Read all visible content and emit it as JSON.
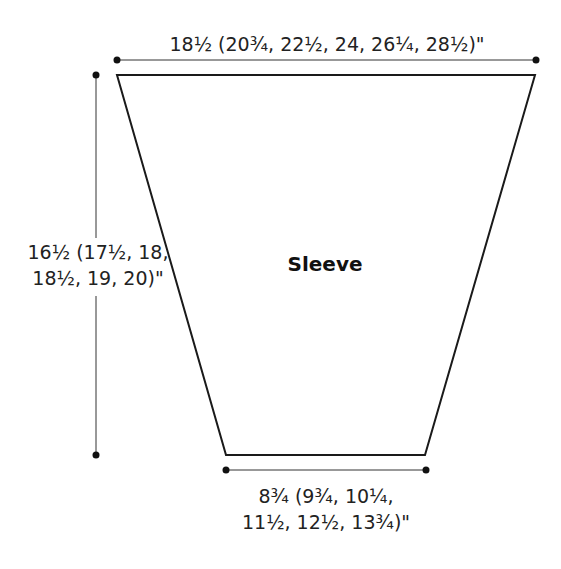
{
  "diagram": {
    "type": "schematic",
    "piece_name": "Sleeve",
    "shape": "trapezoid",
    "dimensions": {
      "top_width": {
        "line1": "18½ (20¾, 22½, 24, 26¼, 28½)\""
      },
      "height": {
        "line1": "16½ (17½, 18,",
        "line2": "18½, 19, 20)\""
      },
      "bottom_width": {
        "line1": "8¾ (9¾, 10¼,",
        "line2": "11½, 12½, 13¾)\""
      }
    },
    "colors": {
      "stroke": "#1a1a1a",
      "background": "#ffffff"
    }
  }
}
